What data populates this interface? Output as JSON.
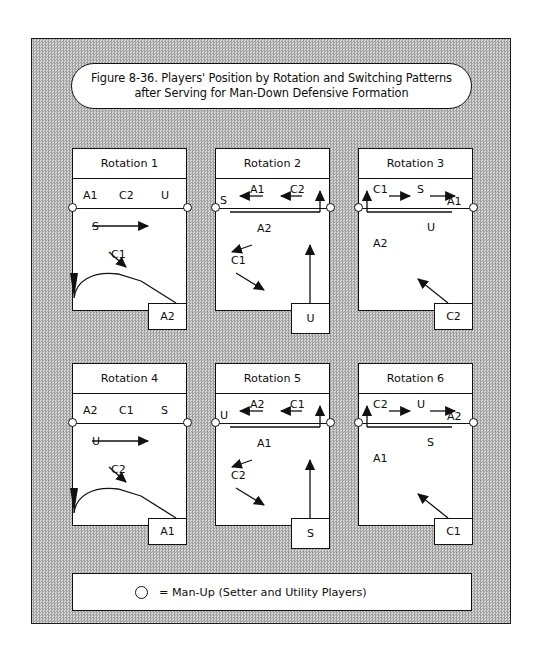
{
  "figure": {
    "title_line1": "Figure 8-36. Players' Position by Rotation and Switching Patterns",
    "title_line2": "after Serving for Man-Down Defensive Formation"
  },
  "legend": {
    "symbol": "circle-outline",
    "text": "= Man-Up (Setter and Utility Players)"
  },
  "courts": [
    {
      "id": "rotation-1",
      "title": "Rotation 1",
      "front_row": [
        "A1",
        "C2",
        "U"
      ],
      "back_row_labels": [
        "S",
        "C1"
      ],
      "server_box": "A2",
      "switch_notes": "S moves right along front of back court; C1 moves down-right; A2 enters from back-right and curves up-left"
    },
    {
      "id": "rotation-2",
      "title": "Rotation 2",
      "front_row": [
        "S",
        "A1",
        "C2"
      ],
      "back_row_labels": [
        "A2",
        "C1"
      ],
      "server_box": "U",
      "switch_notes": "A1 and C2 move left toward S; A2 moves left; C1 moves down-right; U advances straight up"
    },
    {
      "id": "rotation-3",
      "title": "Rotation 3",
      "front_row": [
        "C1",
        "S",
        "A1"
      ],
      "back_row_labels": [
        "U",
        "A2"
      ],
      "server_box": "C2",
      "switch_notes": "C1 and S move right toward A1; C2 enters from bottom-right moving up-left"
    },
    {
      "id": "rotation-4",
      "title": "Rotation 4",
      "front_row": [
        "A2",
        "C1",
        "S"
      ],
      "back_row_labels": [
        "U",
        "C2"
      ],
      "server_box": "A1",
      "switch_notes": "U moves right along front of back court; C2 moves down-right; A1 enters from back-right and curves up-left"
    },
    {
      "id": "rotation-5",
      "title": "Rotation 5",
      "front_row": [
        "U",
        "A2",
        "C1"
      ],
      "back_row_labels": [
        "A1",
        "C2"
      ],
      "server_box": "S",
      "switch_notes": "A2 and C1 move left toward U; A1 moves left; C2 moves down-right; S advances straight up"
    },
    {
      "id": "rotation-6",
      "title": "Rotation 6",
      "front_row": [
        "C2",
        "U",
        "A2"
      ],
      "back_row_labels": [
        "S",
        "A1"
      ],
      "server_box": "C1",
      "switch_notes": "C2 and U move right toward A2; C1 enters from bottom-right moving up-left"
    }
  ],
  "colors": {
    "ink": "#111111",
    "paper": "#ffffff",
    "texture_light": "#d6d6d6",
    "texture_dark": "#a0a0a0"
  }
}
